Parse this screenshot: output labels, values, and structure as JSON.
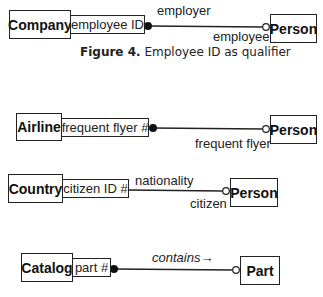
{
  "figure_caption": {
    "label": "Figure 4.",
    "text": "Employee ID as qualifier"
  },
  "diagrams": [
    {
      "source_class": "Company",
      "qualifier": "employee ID",
      "target_class": "Person",
      "source_role": "employer",
      "target_role": "employee",
      "source_end": "filled-dot",
      "target_end": "open-circle"
    },
    {
      "source_class": "Airline",
      "qualifier": "frequent flyer #",
      "target_class": "Person",
      "target_role": "frequent flyer",
      "source_end": "filled-dot",
      "target_end": "open-circle"
    },
    {
      "source_class": "Country",
      "qualifier": "citizen ID #",
      "target_class": "Person",
      "source_role": "nationality",
      "target_role": "citizen",
      "source_end": "none",
      "target_end": "open-circle"
    },
    {
      "source_class": "Catalog",
      "qualifier": "part #",
      "target_class": "Part",
      "association_name": "contains→",
      "source_end": "filled-dot",
      "target_end": "open-circle"
    }
  ]
}
